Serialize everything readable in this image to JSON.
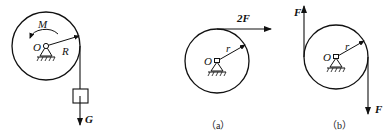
{
  "figures": [
    {
      "id": "main",
      "labels": {
        "moment": "M",
        "center": "O",
        "radius": "R",
        "weight": "G"
      }
    },
    {
      "id": "a",
      "caption": "（a）",
      "labels": {
        "force": "2F",
        "center": "O",
        "radius": "r"
      }
    },
    {
      "id": "b",
      "caption": "（b）",
      "labels": {
        "force_up": "F",
        "force_down": "F",
        "center": "O",
        "radius": "r"
      }
    }
  ]
}
